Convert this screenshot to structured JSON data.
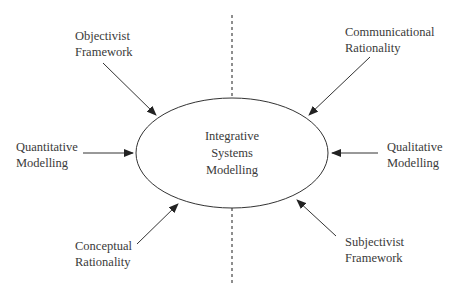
{
  "diagram": {
    "center": {
      "lines": [
        "Integrative",
        "Systems",
        "Modelling"
      ]
    },
    "nodes": [
      {
        "id": "objectivist",
        "lines": [
          "Objectivist",
          "Framework"
        ]
      },
      {
        "id": "communicational",
        "lines": [
          "Communicational",
          "Rationality"
        ]
      },
      {
        "id": "quantitative",
        "lines": [
          "Quantitative",
          "Modelling"
        ]
      },
      {
        "id": "qualitative",
        "lines": [
          "Qualitative",
          "Modelling"
        ]
      },
      {
        "id": "conceptual",
        "lines": [
          "Conceptual",
          "Rationality"
        ]
      },
      {
        "id": "subjectivist",
        "lines": [
          "Subjectivist",
          "Framework"
        ]
      }
    ],
    "edges": [
      {
        "from": "objectivist",
        "to": "center"
      },
      {
        "from": "communicational",
        "to": "center"
      },
      {
        "from": "quantitative",
        "to": "center"
      },
      {
        "from": "qualitative",
        "to": "center"
      },
      {
        "from": "conceptual",
        "to": "center"
      },
      {
        "from": "subjectivist",
        "to": "center"
      }
    ],
    "divider": {
      "style": "dashed",
      "orientation": "vertical"
    },
    "colors": {
      "stroke": "#333333",
      "text": "#3a3a3a",
      "background": "#ffffff"
    }
  }
}
